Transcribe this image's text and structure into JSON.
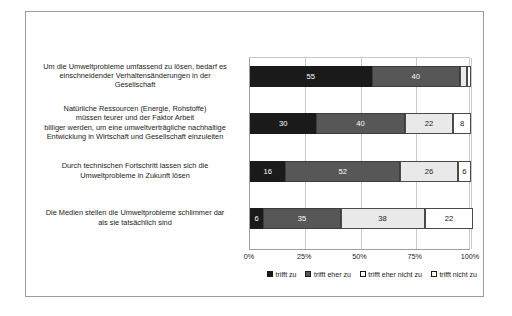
{
  "chart_data": {
    "type": "bar",
    "orientation": "horizontal",
    "stacked": true,
    "stack_mode": "percent",
    "title": "",
    "xlabel": "",
    "ylabel": "",
    "xlim": [
      0,
      100
    ],
    "grid": true,
    "legend_position": "bottom-right",
    "tick_labels": [
      "0%",
      "25%",
      "50%",
      "75%",
      "100%"
    ],
    "tick_values": [
      0,
      25,
      50,
      75,
      100
    ],
    "categories": [
      "Um die Umweltprobleme umfassend zu lösen, bedarf es einschneidender Verhaltensänderungen in der Gesellschaft",
      "Natürliche Ressourcen (Energie, Rohstoffe) müssen teurer und der Faktor Arbeit billiger werden, um eine umweltverträgliche nachhaltige Entwicklung in Wirtschaft und Gesellschaft einzuleiten",
      "Durch technischen Fortschritt lassen sich die Umweltprobleme in Zukunft lösen",
      "Die Medien stellen die Umweltprobleme schlimmer dar als sie tatsächlich sind"
    ],
    "category_lines": [
      [
        "Um die Umweltprobleme umfassend zu lösen, bedarf es",
        "einschneidender Verhaltensänderungen in der",
        "Gesellschaft"
      ],
      [
        "Natürliche Ressourcen (Energie, Rohstoffe)",
        "müssen teurer und der Faktor Arbeit",
        "billiger werden, um eine umweltverträgliche nachhaltige",
        "Entwicklung in Wirtschaft und Gesellschaft einzuleiten"
      ],
      [
        "Durch technischen Fortschritt lassen sich die",
        "Umweltprobleme in Zukunft lösen"
      ],
      [
        "Die Medien stellen die Umweltprobleme schlimmer dar",
        "als sie tatsächlich sind"
      ]
    ],
    "series": [
      {
        "name": "trifft zu",
        "color": "#1a1a1a",
        "values": [
          55,
          30,
          16,
          6
        ]
      },
      {
        "name": "trifft eher zu",
        "color": "#575757",
        "values": [
          40,
          40,
          52,
          35
        ]
      },
      {
        "name": "trifft eher nicht zu",
        "color": "#e9e9e9",
        "values": [
          3,
          22,
          26,
          38
        ]
      },
      {
        "name": "trifft nicht zu",
        "color": "#ffffff",
        "values": [
          2,
          8,
          6,
          22
        ]
      }
    ],
    "value_labels": [
      [
        "55",
        "40",
        "",
        ""
      ],
      [
        "30",
        "40",
        "22",
        "8"
      ],
      [
        "16",
        "52",
        "26",
        "6"
      ],
      [
        "6",
        "35",
        "38",
        "22"
      ]
    ]
  },
  "legend": {
    "items": [
      {
        "label": "trifft zu"
      },
      {
        "label": "trifft eher zu"
      },
      {
        "label": "trifft eher nicht zu"
      },
      {
        "label": "trifft nicht zu"
      }
    ]
  }
}
